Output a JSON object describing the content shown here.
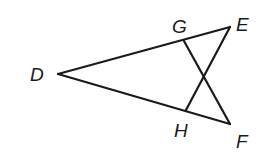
{
  "figure": {
    "type": "geometry-diagram",
    "points": {
      "D": {
        "x": 58,
        "y": 74,
        "label": "D",
        "label_x": 30,
        "label_y": 81
      },
      "G": {
        "x": 184,
        "y": 41,
        "label": "G",
        "label_x": 172,
        "label_y": 33
      },
      "E": {
        "x": 230,
        "y": 27,
        "label": "E",
        "label_x": 236,
        "label_y": 31
      },
      "H": {
        "x": 186,
        "y": 110,
        "label": "H",
        "label_x": 174,
        "label_y": 137
      },
      "F": {
        "x": 230,
        "y": 124,
        "label": "F",
        "label_x": 236,
        "label_y": 148
      }
    },
    "segments": [
      {
        "name": "segment-DE",
        "from": "D",
        "to": "E"
      },
      {
        "name": "segment-DF",
        "from": "D",
        "to": "F"
      },
      {
        "name": "segment-GF",
        "from": "G",
        "to": "F"
      },
      {
        "name": "segment-HE",
        "from": "H",
        "to": "E"
      }
    ],
    "labels": [
      "D",
      "G",
      "E",
      "H",
      "F"
    ]
  }
}
